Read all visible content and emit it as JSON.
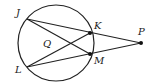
{
  "diagram": {
    "type": "circle-secants",
    "circle": {
      "cx": 56,
      "cy": 43,
      "r": 38
    },
    "points": {
      "J": {
        "label": "J",
        "x": 27,
        "y": 19,
        "lx": 16,
        "ly": 16
      },
      "K": {
        "label": "K",
        "x": 90,
        "y": 33,
        "lx": 94,
        "ly": 29
      },
      "L": {
        "label": "L",
        "x": 27,
        "y": 67,
        "lx": 15,
        "ly": 73
      },
      "M": {
        "label": "M",
        "x": 90,
        "y": 54,
        "lx": 94,
        "ly": 64
      },
      "P": {
        "label": "P",
        "x": 141,
        "y": 43,
        "lx": 138,
        "ly": 35
      },
      "Q": {
        "label": "Q",
        "lx": 43,
        "ly": 47
      }
    },
    "segments": [
      [
        "J",
        "P"
      ],
      [
        "L",
        "P"
      ],
      [
        "J",
        "M"
      ],
      [
        "L",
        "K"
      ]
    ],
    "stroke_color": "#222222"
  }
}
